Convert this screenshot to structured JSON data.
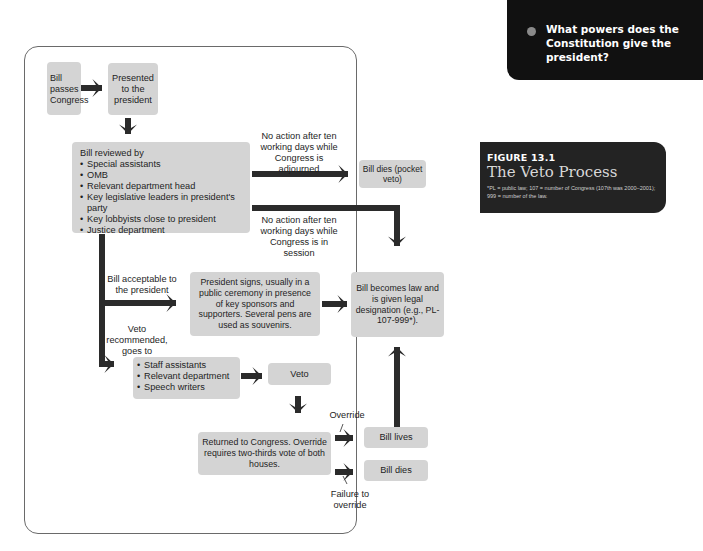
{
  "sidebar_question": {
    "text": "What powers does the Constitution give the president?",
    "bullet_color": "#8a8a8a"
  },
  "figure": {
    "number": "FIGURE 13.1",
    "title": "The Veto Process",
    "footnote": "*PL = public law; 107 = number of Congress (107th was 2000–2001); 999 = number of the law."
  },
  "flowchart": {
    "colors": {
      "box": "#d4d4d4",
      "arrow": "#2b2b2b",
      "frame": "#6a6a6a"
    },
    "nodes": {
      "bill_passes": "Bill passes Congress",
      "presented": "Presented to the president",
      "reviewed_title": "Bill reviewed by",
      "reviewed_items": [
        "Special assistants",
        "OMB",
        "Relevant department head",
        "Key legislative leaders in president's party",
        "Key lobbyists close to president",
        "Justice department"
      ],
      "pocket_veto": "Bill dies (pocket veto)",
      "president_signs": "President signs, usually in a public ceremony in presence of key sponsors and supporters. Several pens are used as souvenirs.",
      "becomes_law": "Bill becomes law and is given legal designation (e.g., PL-107-999*).",
      "veto_reviewers": [
        "Staff assistants",
        "Relevant department",
        "Speech writers"
      ],
      "veto": "Veto",
      "returned": "Returned to Congress. Override requires two-thirds vote of both houses.",
      "bill_lives": "Bill lives",
      "bill_dies": "Bill dies"
    },
    "edge_labels": {
      "adjourned": "No action after ten working days while Congress is adjourned",
      "in_session": "No action after ten working days while Congress is in session",
      "acceptable": "Bill acceptable to the president",
      "veto_recommended": "Veto recommended, goes to",
      "override": "Override",
      "failure": "Failure to override"
    }
  }
}
